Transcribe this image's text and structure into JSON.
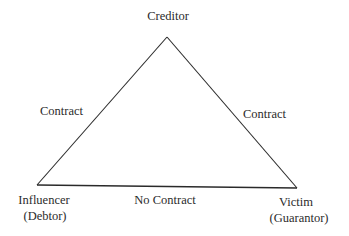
{
  "diagram": {
    "nodes": {
      "top": {
        "label": "Creditor"
      },
      "bottom_left": {
        "label": "Influencer",
        "sublabel": "(Debtor)"
      },
      "bottom_right": {
        "label": "Victim",
        "sublabel": "(Guarantor)"
      }
    },
    "edges": {
      "left": {
        "label": "Contract"
      },
      "right": {
        "label": "Contract"
      },
      "bottom": {
        "label": "No Contract"
      }
    },
    "colors": {
      "line": "#2a2a2a",
      "text": "#2b2b2b",
      "background": "#ffffff"
    }
  }
}
